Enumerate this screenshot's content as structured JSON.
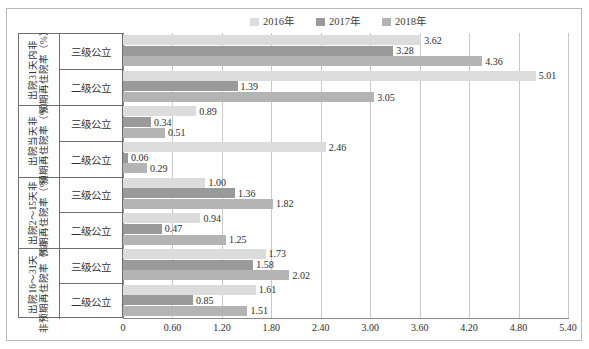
{
  "chart_data": {
    "type": "bar",
    "orientation": "horizontal",
    "title": "",
    "xlabel": "",
    "ylabel": "",
    "xlim": [
      0,
      5.4
    ],
    "xticks": [
      "0",
      "0.60",
      "1.20",
      "1.80",
      "2.40",
      "3.00",
      "3.60",
      "4.20",
      "4.80",
      "5.40"
    ],
    "xtick_values": [
      0,
      0.6,
      1.2,
      1.8,
      2.4,
      3.0,
      3.6,
      4.2,
      4.8,
      5.4
    ],
    "grid": true,
    "legend_position": "top",
    "series": [
      {
        "name": "2016年",
        "color": "#dcdcdc"
      },
      {
        "name": "2017年",
        "color": "#9a9a9a"
      },
      {
        "name": "2018年",
        "color": "#b4b4b4"
      }
    ],
    "groups": [
      {
        "title_line1": "出院31天内非",
        "title_line2": "预期再住院率（%）",
        "subgroups": [
          {
            "label": "三级公立",
            "values": [
              3.62,
              3.28,
              4.36
            ]
          },
          {
            "label": "二级公立",
            "values": [
              5.01,
              1.39,
              3.05
            ]
          }
        ]
      },
      {
        "title_line1": "出院当天非",
        "title_line2": "预期再住院率（%）",
        "subgroups": [
          {
            "label": "三级公立",
            "values": [
              0.89,
              0.34,
              0.51
            ]
          },
          {
            "label": "二级公立",
            "values": [
              2.46,
              0.06,
              0.29
            ]
          }
        ]
      },
      {
        "title_line1": "出院2～15天非",
        "title_line2": "预期再住院率（%）",
        "subgroups": [
          {
            "label": "三级公立",
            "values": [
              1.0,
              1.36,
              1.82
            ]
          },
          {
            "label": "二级公立",
            "values": [
              0.94,
              0.47,
              1.25
            ]
          }
        ]
      },
      {
        "title_line1": "出院16～31天",
        "title_line2": "非预期再住院率（%）",
        "subgroups": [
          {
            "label": "三级公立",
            "values": [
              1.73,
              1.58,
              2.02
            ]
          },
          {
            "label": "二级公立",
            "values": [
              1.61,
              0.85,
              1.51
            ]
          }
        ]
      }
    ],
    "labels_text": {
      "g0s0": [
        "3.62",
        "3.28",
        "4.36"
      ],
      "g0s1": [
        "5.01",
        "1.39",
        "3.05"
      ],
      "g1s0": [
        "0.89",
        "0.34",
        "0.51"
      ],
      "g1s1": [
        "2.46",
        "0.06",
        "0.29"
      ],
      "g2s0": [
        "1.00",
        "1.36",
        "1.82"
      ],
      "g2s1": [
        "0.94",
        "0.47",
        "1.25"
      ],
      "g3s0": [
        "1.73",
        "1.58",
        "2.02"
      ],
      "g3s1": [
        "1.61",
        "0.85",
        "1.51"
      ]
    }
  }
}
